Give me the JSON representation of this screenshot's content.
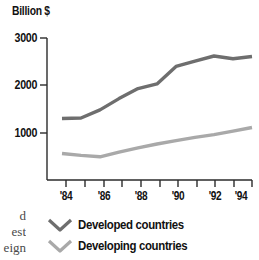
{
  "chart_data": {
    "type": "line",
    "title": "",
    "ylabel": "Billion $",
    "xlabel": "",
    "ylim": [
      0,
      3000
    ],
    "yticks": [
      1000,
      2000,
      3000
    ],
    "ytick_labels": [
      "1000",
      "2000",
      "3000"
    ],
    "grid": false,
    "legend_position": "below-axes-left",
    "x": [
      1984,
      1985,
      1986,
      1987,
      1988,
      1989,
      1990,
      1991,
      1992,
      1993,
      1994
    ],
    "xtick_labels": [
      "'84",
      "",
      "'86",
      "",
      "'88",
      "",
      "'90",
      "",
      "'92",
      "",
      "'94"
    ],
    "xticks_major": [
      "'84",
      "'86",
      "'88",
      "'90",
      "'92",
      "'94"
    ],
    "series": [
      {
        "name": "Developed countries",
        "color": "#6e6e6e",
        "values": [
          1300,
          1310,
          1480,
          1720,
          1930,
          2030,
          2400,
          2510,
          2620,
          2560,
          2610
        ]
      },
      {
        "name": "Developing countries",
        "color": "#a9a9a9",
        "values": [
          560,
          520,
          490,
          590,
          680,
          760,
          830,
          900,
          960,
          1030,
          1110
        ]
      }
    ]
  },
  "axis": {
    "unit_title": "Billion $",
    "y_tick_labels": [
      "3000",
      "2000",
      "1000"
    ],
    "x_tick_labels": [
      "'84",
      "'86",
      "'88",
      "'90",
      "'92",
      "'94"
    ]
  },
  "legend": {
    "items": [
      {
        "label": "Developed countries",
        "color": "#6e6e6e"
      },
      {
        "label": "Developing countries",
        "color": "#a9a9a9"
      }
    ]
  },
  "margin_text": {
    "line1": "d",
    "line2": "est",
    "line3": "eign"
  }
}
